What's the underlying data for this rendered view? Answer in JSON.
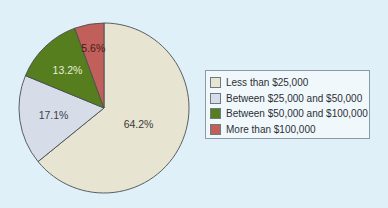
{
  "chart_data": {
    "type": "pie",
    "title": "",
    "categories": [
      "Less than $25,000",
      "Between $25,000 and $50,000",
      "Between $50,000 and $100,000",
      "More than $100,000"
    ],
    "values": [
      64.2,
      17.1,
      13.2,
      5.6
    ],
    "labels": [
      "64.2%",
      "17.1%",
      "13.2%",
      "5.6%"
    ],
    "colors": [
      "#e8e4d2",
      "#d6dce8",
      "#567d1e",
      "#c1605a"
    ],
    "label_colors": [
      "#3a3a3a",
      "#3a3f4a",
      "#e6efd6",
      "#4a1a18"
    ],
    "start_angle_deg": 0,
    "direction": "clockwise",
    "legend_position": "right"
  },
  "legend": {
    "items": [
      {
        "label": "Less than $25,000",
        "color": "#e8e4d2"
      },
      {
        "label": "Between $25,000 and $50,000",
        "color": "#d6dce8"
      },
      {
        "label": "Between $50,000 and $100,000",
        "color": "#567d1e"
      },
      {
        "label": "More than $100,000",
        "color": "#c1605a"
      }
    ]
  }
}
